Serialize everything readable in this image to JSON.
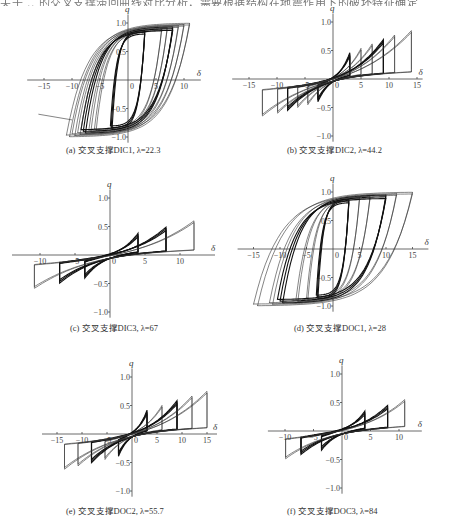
{
  "header": {
    "partial_text": "关于 .. 的交叉支撑滞回曲线对比分析，需要根据结构在地震作用下的破坏特征确定"
  },
  "axes": {
    "x_label": "δ",
    "y_label": "q"
  },
  "panels": [
    {
      "id": "a",
      "caption": "(a) 交叉支撑DIC1, λ=22.3",
      "origin": [
        128,
        80
      ],
      "sx": 5.6,
      "sy": 57,
      "x_ticks": [
        -15,
        -10,
        -5,
        0,
        5,
        10
      ],
      "x_tick_labels": [
        "-15",
        "-10",
        "-5",
        "0",
        "5",
        "10"
      ],
      "y_ticks": [
        1.0,
        0.5,
        -0.5,
        -1.0
      ],
      "y_tick_labels": [
        "1.0",
        "0.5",
        "-0.5",
        "-1.0"
      ],
      "x_range": [
        -18,
        13
      ],
      "y_range": [
        -1.1,
        1.15
      ],
      "caption_pos": [
        66,
        143
      ]
    },
    {
      "id": "b",
      "caption": "(b) 交叉支撑DIC2, λ=44.2",
      "origin": [
        333,
        79
      ],
      "sx": 5.6,
      "sy": 57,
      "x_ticks": [
        -15,
        -10,
        -5,
        0,
        5,
        10,
        15
      ],
      "x_tick_labels": [
        "-15",
        "-10",
        "-5",
        "0",
        "5",
        "10",
        "15"
      ],
      "y_ticks": [
        1.0,
        0.5,
        -0.5,
        -1.0
      ],
      "y_tick_labels": [
        "1.0",
        "0.5",
        "-0.5",
        "-1.0"
      ],
      "x_range": [
        -18,
        16
      ],
      "y_range": [
        -1.1,
        1.15
      ],
      "caption_pos": [
        287,
        143
      ]
    },
    {
      "id": "c",
      "caption": "(c) 交叉支撑DIC3, λ=67",
      "origin": [
        110,
        255
      ],
      "sx": 7.0,
      "sy": 57,
      "x_ticks": [
        -10,
        -5,
        0,
        5,
        10
      ],
      "x_tick_labels": [
        "-10",
        "-5",
        "0",
        "5",
        "10"
      ],
      "y_ticks": [
        1.0,
        0.5,
        -0.5,
        -1.0
      ],
      "y_tick_labels": [
        "1.0",
        "0.5",
        "-0.5",
        "-1.0"
      ],
      "x_range": [
        -14,
        15
      ],
      "y_range": [
        -1.1,
        1.15
      ],
      "caption_pos": [
        70,
        321
      ]
    },
    {
      "id": "d",
      "caption": "(d) 交叉支撑DOC1, λ=28",
      "origin": [
        333,
        249
      ],
      "sx": 5.3,
      "sy": 57,
      "x_ticks": [
        -15,
        -10,
        -5,
        0,
        5,
        10,
        15
      ],
      "x_tick_labels": [
        "-15",
        "-10",
        "-5",
        "0",
        "5",
        "10",
        "15"
      ],
      "y_ticks": [
        1.0,
        0.5,
        -0.5,
        -1.0
      ],
      "y_tick_labels": [
        "1.0",
        "0.5",
        "-0.5",
        "-1.0"
      ],
      "x_range": [
        -18,
        18
      ],
      "y_range": [
        -1.1,
        1.15
      ],
      "caption_pos": [
        294,
        321
      ]
    },
    {
      "id": "e",
      "caption": "(e) 交叉支撑DOC2, λ=55.7",
      "origin": [
        132,
        434
      ],
      "sx": 5.0,
      "sy": 57,
      "x_ticks": [
        -15,
        -10,
        -5,
        0,
        5,
        10,
        15
      ],
      "x_tick_labels": [
        "-15",
        "-10",
        "-5",
        "0",
        "5",
        "10",
        "15"
      ],
      "y_ticks": [
        1.0,
        0.5,
        -0.5,
        -1.0
      ],
      "y_tick_labels": [
        "1.0",
        "0.5",
        "-0.5",
        "-1.0"
      ],
      "x_range": [
        -18,
        17
      ],
      "y_range": [
        -1.1,
        1.15
      ],
      "caption_pos": [
        66,
        504
      ]
    },
    {
      "id": "f",
      "caption": "(f) 交叉支撑DOC3, λ=84",
      "origin": [
        342,
        431
      ],
      "sx": 5.7,
      "sy": 57,
      "x_ticks": [
        -10,
        -5,
        0,
        5,
        10
      ],
      "x_tick_labels": [
        "-10",
        "-5",
        "0",
        "5",
        "10"
      ],
      "y_ticks": [
        1.0,
        0.5,
        -0.5,
        -1.0
      ],
      "y_tick_labels": [
        "1.0",
        "0.5",
        "-0.5",
        "-1.0"
      ],
      "x_range": [
        -13,
        14
      ],
      "y_range": [
        -1.1,
        1.15
      ],
      "caption_pos": [
        287,
        504
      ]
    }
  ],
  "chart_data": [
    {
      "type": "line",
      "title": "(a) 交叉支撑DIC1, λ=22.3",
      "xlabel": "δ",
      "ylabel": "q",
      "xlim": [
        -17,
        12
      ],
      "ylim": [
        -1.1,
        1.1
      ],
      "x_ticks": [
        -15,
        -10,
        -5,
        0,
        5,
        10
      ],
      "y_ticks": [
        -1.0,
        -0.5,
        0.5,
        1.0
      ],
      "series": [
        {
          "name": "loops",
          "amplitudes": [
            3,
            6,
            7,
            8,
            9,
            10,
            11
          ],
          "q_pos_max": 1.0,
          "q_neg_min": -1.0,
          "pinched": false,
          "tail_left": {
            "x": [
              -16,
              -10
            ],
            "y": [
              -0.6,
              -0.7
            ]
          }
        }
      ]
    },
    {
      "type": "line",
      "title": "(b) 交叉支撑DIC2, λ=44.2",
      "xlabel": "δ",
      "ylabel": "q",
      "xlim": [
        -17,
        16
      ],
      "ylim": [
        -1.1,
        1.1
      ],
      "x_ticks": [
        -15,
        -10,
        -5,
        0,
        5,
        10,
        15
      ],
      "y_ticks": [
        -1.0,
        -0.5,
        0.5,
        1.0
      ],
      "series": [
        {
          "name": "loops",
          "amplitudes": [
            3,
            5,
            7,
            9,
            11,
            14
          ],
          "q_pos_max": 0.85,
          "q_neg_min": -1.0,
          "pinched": true
        }
      ]
    },
    {
      "type": "line",
      "title": "(c) 交叉支撑DIC3, λ=67",
      "xlabel": "δ",
      "ylabel": "q",
      "xlim": [
        -12,
        13
      ],
      "ylim": [
        -1.05,
        1.05
      ],
      "x_ticks": [
        -10,
        -5,
        0,
        5,
        10
      ],
      "y_ticks": [
        -1.0,
        -0.5,
        0.5,
        1.0
      ],
      "series": [
        {
          "name": "loops",
          "amplitudes": [
            4,
            8,
            12
          ],
          "q_pos_max": 0.6,
          "q_neg_min": -0.9,
          "pinched": true
        }
      ]
    },
    {
      "type": "line",
      "title": "(d) 交叉支撑DOC1, λ=28",
      "xlabel": "δ",
      "ylabel": "q",
      "xlim": [
        -16,
        16
      ],
      "ylim": [
        -1.05,
        1.05
      ],
      "x_ticks": [
        -15,
        -10,
        -5,
        0,
        5,
        10,
        15
      ],
      "y_ticks": [
        -1.0,
        -0.5,
        0.5,
        1.0
      ],
      "series": [
        {
          "name": "loops",
          "amplitudes": [
            3,
            5,
            7,
            10,
            12,
            15
          ],
          "q_pos_max": 1.0,
          "q_neg_min": -1.0,
          "pinched": false
        }
      ]
    },
    {
      "type": "line",
      "title": "(e) 交叉支撑DOC2, λ=55.7",
      "xlabel": "δ",
      "ylabel": "q",
      "xlim": [
        -16,
        16
      ],
      "ylim": [
        -1.05,
        1.05
      ],
      "x_ticks": [
        -15,
        -10,
        -5,
        0,
        5,
        10,
        15
      ],
      "y_ticks": [
        -1.0,
        -0.5,
        0.5,
        1.0
      ],
      "series": [
        {
          "name": "loops",
          "amplitudes": [
            3,
            6,
            9,
            12,
            15
          ],
          "q_pos_max": 0.75,
          "q_neg_min": -0.95,
          "pinched": true
        }
      ]
    },
    {
      "type": "line",
      "title": "(f) 交叉支撑DOC3, λ=84",
      "xlabel": "δ",
      "ylabel": "q",
      "xlim": [
        -12,
        13
      ],
      "ylim": [
        -1.05,
        1.05
      ],
      "x_ticks": [
        -10,
        -5,
        0,
        5,
        10
      ],
      "y_ticks": [
        -1.0,
        -0.5,
        0.5,
        1.0
      ],
      "series": [
        {
          "name": "loops",
          "amplitudes": [
            4,
            8,
            11
          ],
          "q_pos_max": 0.55,
          "q_neg_min": -0.75,
          "pinched": true
        }
      ]
    }
  ]
}
